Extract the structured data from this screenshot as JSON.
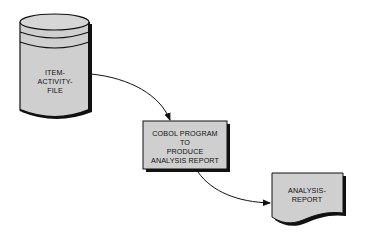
{
  "diagram": {
    "type": "flowchart",
    "colors": {
      "shape_fill": "#cfcfcf",
      "stroke": "#111111",
      "background": "#ffffff"
    },
    "nodes": [
      {
        "id": "item-activity-file",
        "shape": "cylinder",
        "label_lines": [
          "ITEM-",
          "ACTIVITY-",
          "FILE"
        ]
      },
      {
        "id": "cobol-program",
        "shape": "process-box",
        "label_lines": [
          "COBOL PROGRAM",
          "TO",
          "PRODUCE",
          "ANALYSIS REPORT"
        ]
      },
      {
        "id": "analysis-report",
        "shape": "document",
        "label_lines": [
          "ANALYSIS-",
          "REPORT"
        ]
      }
    ],
    "edges": [
      {
        "from": "item-activity-file",
        "to": "cobol-program"
      },
      {
        "from": "cobol-program",
        "to": "analysis-report"
      }
    ]
  }
}
